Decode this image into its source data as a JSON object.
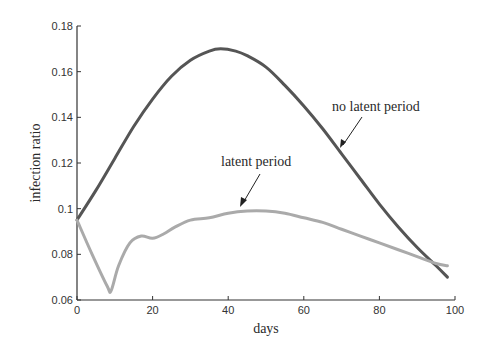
{
  "chart_data": {
    "type": "line",
    "title": "",
    "xlabel": "days",
    "ylabel": "infection ratio",
    "xlim": [
      0,
      100
    ],
    "ylim": [
      0.06,
      0.18
    ],
    "grid": false,
    "legend": "none (inline annotations with arrows)",
    "xticks": [
      0,
      20,
      40,
      60,
      80,
      100
    ],
    "xtick_labels": [
      "0",
      "20",
      "40",
      "60",
      "80",
      "100"
    ],
    "yticks": [
      0.06,
      0.08,
      0.1,
      0.12,
      0.14,
      0.16,
      0.18
    ],
    "ytick_labels": [
      "0.06",
      "0.08",
      "0.1",
      "0.12",
      "0.14",
      "0.16",
      "0.18"
    ],
    "series": [
      {
        "name": "no latent period",
        "color": "#555555",
        "x": [
          0,
          5,
          10,
          15,
          20,
          25,
          30,
          35,
          38,
          42,
          45,
          50,
          55,
          60,
          65,
          70,
          75,
          80,
          85,
          90,
          95,
          98
        ],
        "y": [
          0.095,
          0.108,
          0.122,
          0.136,
          0.148,
          0.158,
          0.165,
          0.169,
          0.17,
          0.169,
          0.167,
          0.162,
          0.154,
          0.145,
          0.135,
          0.124,
          0.113,
          0.102,
          0.092,
          0.083,
          0.075,
          0.07
        ]
      },
      {
        "name": "latent period",
        "color": "#aaaaaa",
        "x": [
          0,
          4,
          8,
          9,
          11,
          14,
          17,
          20,
          23,
          26,
          30,
          35,
          40,
          45,
          50,
          55,
          60,
          65,
          70,
          75,
          80,
          85,
          90,
          95,
          98
        ],
        "y": [
          0.095,
          0.08,
          0.066,
          0.064,
          0.075,
          0.085,
          0.088,
          0.087,
          0.089,
          0.092,
          0.095,
          0.096,
          0.098,
          0.099,
          0.099,
          0.098,
          0.096,
          0.094,
          0.091,
          0.088,
          0.085,
          0.082,
          0.079,
          0.076,
          0.075
        ]
      }
    ],
    "annotations": [
      {
        "text": "no latent period",
        "x_text": 68,
        "y_text": 0.138,
        "arrow_to_x": 66,
        "arrow_to_y": 0.134
      },
      {
        "text": "latent period",
        "x_text": 33,
        "y_text": 0.118,
        "arrow_to_x": 38,
        "arrow_to_y": 0.098
      }
    ]
  },
  "labels": {
    "xlabel": "days",
    "ylabel": "infection ratio",
    "annotation_no_latent": "no latent period",
    "annotation_latent": "latent period"
  }
}
